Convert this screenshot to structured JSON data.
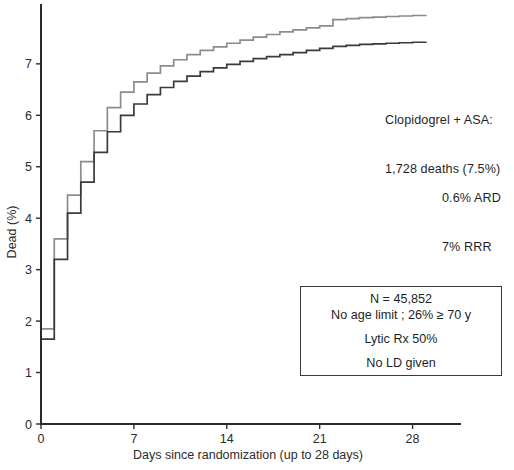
{
  "chart_data": {
    "type": "line",
    "title": "",
    "xlabel": "Days since randomization (up to 28 days)",
    "ylabel": "Dead (%)",
    "xlim": [
      0,
      29
    ],
    "ylim": [
      0,
      8.1
    ],
    "xticks": [
      0,
      7,
      14,
      21,
      28
    ],
    "xtick_labels": [
      "0",
      "7",
      "14",
      "21",
      "28"
    ],
    "yticks": [
      0,
      1,
      2,
      3,
      4,
      5,
      6,
      7
    ],
    "ytick_labels": [
      "0",
      "1",
      "2",
      "3",
      "4",
      "5",
      "6",
      "7"
    ],
    "grid": false,
    "legend": "none",
    "step_style": "post",
    "series": [
      {
        "name": "Placebo + ASA",
        "color": "#8c8c8c",
        "x": [
          0,
          1,
          2,
          3,
          4,
          5,
          6,
          7,
          8,
          9,
          10,
          11,
          12,
          13,
          14,
          15,
          16,
          17,
          18,
          19,
          20,
          21,
          22,
          23,
          24,
          25,
          26,
          27,
          28,
          29
        ],
        "values": [
          1.85,
          3.6,
          4.45,
          5.1,
          5.7,
          6.15,
          6.45,
          6.65,
          6.82,
          6.96,
          7.08,
          7.18,
          7.26,
          7.33,
          7.4,
          7.46,
          7.52,
          7.57,
          7.62,
          7.66,
          7.7,
          7.74,
          7.86,
          7.88,
          7.9,
          7.91,
          7.92,
          7.93,
          7.94,
          7.95
        ]
      },
      {
        "name": "Clopidogrel + ASA",
        "color": "#3a3a3a",
        "x": [
          0,
          1,
          2,
          3,
          4,
          5,
          6,
          7,
          8,
          9,
          10,
          11,
          12,
          13,
          14,
          15,
          16,
          17,
          18,
          19,
          20,
          21,
          22,
          23,
          24,
          25,
          26,
          27,
          28,
          29
        ],
        "values": [
          1.65,
          3.2,
          4.1,
          4.7,
          5.28,
          5.68,
          6.0,
          6.22,
          6.4,
          6.54,
          6.66,
          6.76,
          6.85,
          6.92,
          6.99,
          7.05,
          7.1,
          7.14,
          7.18,
          7.22,
          7.26,
          7.3,
          7.34,
          7.36,
          7.38,
          7.39,
          7.4,
          7.41,
          7.42,
          7.43
        ]
      }
    ]
  },
  "annotations": {
    "treatment": {
      "line1": "Clopidogrel + ASA:",
      "line2": "1,728 deaths (7.5%)"
    },
    "stats": {
      "line1": "0.6% ARD",
      "line2": "7% RRR",
      "p_italic": "P",
      "p_rest": " = 0.03"
    },
    "trial_box": {
      "line1": "N = 45,852",
      "line2": "No age limit ; 26% ≥ 70 y",
      "line3": "Lytic Rx 50%",
      "line4": "No LD given"
    }
  },
  "colors": {
    "axis": "#2b2b2b",
    "series_control": "#8c8c8c",
    "series_treatment": "#3a3a3a",
    "box_border": "#3a3a3a",
    "background": "#ffffff"
  }
}
